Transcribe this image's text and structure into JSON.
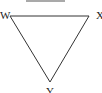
{
  "diagram": {
    "type": "triangle",
    "orientation": "inverted",
    "vertices": [
      {
        "label": "W",
        "x": 10,
        "y": 16
      },
      {
        "label": "X",
        "x": 89,
        "y": 16
      },
      {
        "label": "Y",
        "x": 50,
        "y": 82
      }
    ],
    "top_line": {
      "x1": 26,
      "x2": 65,
      "y": 1
    },
    "stroke_color": "#333333"
  }
}
